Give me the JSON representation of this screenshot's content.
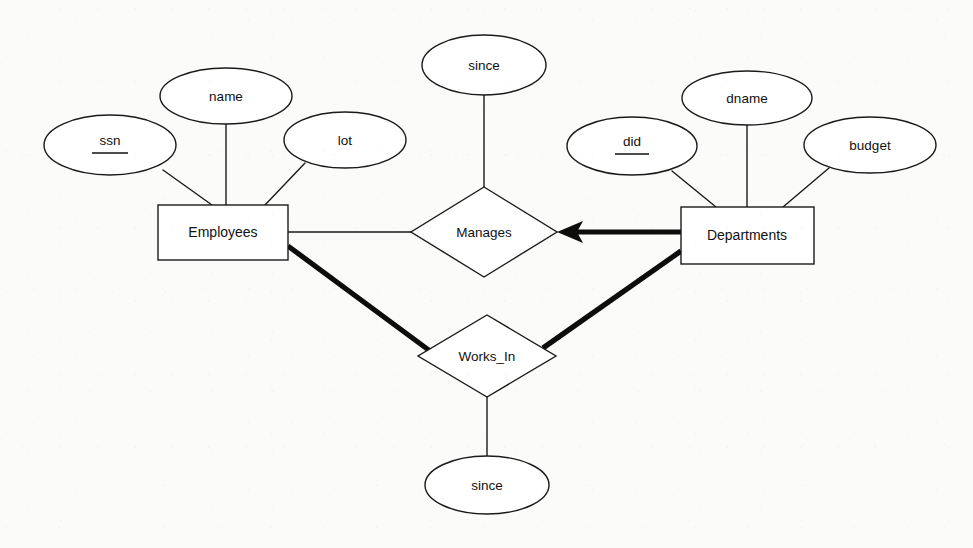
{
  "diagram": {
    "type": "entity-relationship-diagram",
    "notation": "Chen ER",
    "background_color": "#fbfbfa",
    "line_color": "#1a1a1a",
    "entities": [
      {
        "id": "employees",
        "label": "Employees",
        "shape": "rectangle",
        "x": 158,
        "y": 205,
        "width": 130,
        "height": 55
      },
      {
        "id": "departments",
        "label": "Departments",
        "shape": "rectangle",
        "x": 681,
        "y": 207,
        "width": 133,
        "height": 57
      }
    ],
    "relationships": [
      {
        "id": "manages",
        "label": "Manages",
        "shape": "diamond",
        "cx": 484,
        "cy": 232,
        "rx": 73,
        "ry": 45
      },
      {
        "id": "works_in",
        "label": "Works_In",
        "shape": "diamond",
        "cx": 487,
        "cy": 356,
        "rx": 69,
        "ry": 41
      }
    ],
    "attributes": [
      {
        "id": "ssn",
        "label": "ssn",
        "owner": "employees",
        "is_key": true,
        "cx": 110,
        "cy": 145,
        "rx": 66,
        "ry": 30
      },
      {
        "id": "name",
        "label": "name",
        "owner": "employees",
        "is_key": false,
        "cx": 226,
        "cy": 96,
        "rx": 66,
        "ry": 28
      },
      {
        "id": "lot",
        "label": "lot",
        "owner": "employees",
        "is_key": false,
        "cx": 345,
        "cy": 140,
        "rx": 61,
        "ry": 28
      },
      {
        "id": "since_manages",
        "label": "since",
        "owner": "manages",
        "is_key": false,
        "cx": 484,
        "cy": 65,
        "rx": 62,
        "ry": 30
      },
      {
        "id": "did",
        "label": "did",
        "owner": "departments",
        "is_key": true,
        "cx": 632,
        "cy": 146,
        "rx": 65,
        "ry": 29
      },
      {
        "id": "dname",
        "label": "dname",
        "owner": "departments",
        "is_key": false,
        "cx": 747,
        "cy": 98,
        "rx": 65,
        "ry": 27
      },
      {
        "id": "budget",
        "label": "budget",
        "owner": "departments",
        "is_key": false,
        "cx": 870,
        "cy": 145,
        "rx": 66,
        "ry": 28
      },
      {
        "id": "since_works_in",
        "label": "since",
        "owner": "works_in",
        "is_key": false,
        "cx": 487,
        "cy": 485,
        "rx": 62,
        "ry": 29
      }
    ],
    "edges": [
      {
        "id": "e-ssn",
        "from": "ssn",
        "to": "employees",
        "weight": "thin",
        "arrow": false
      },
      {
        "id": "e-name",
        "from": "name",
        "to": "employees",
        "weight": "thin",
        "arrow": false
      },
      {
        "id": "e-lot",
        "from": "lot",
        "to": "employees",
        "weight": "thin",
        "arrow": false
      },
      {
        "id": "e-did",
        "from": "did",
        "to": "departments",
        "weight": "thin",
        "arrow": false
      },
      {
        "id": "e-dname",
        "from": "dname",
        "to": "departments",
        "weight": "thin",
        "arrow": false
      },
      {
        "id": "e-budget",
        "from": "budget",
        "to": "departments",
        "weight": "thin",
        "arrow": false
      },
      {
        "id": "e-since-m",
        "from": "since_manages",
        "to": "manages",
        "weight": "thin",
        "arrow": false
      },
      {
        "id": "e-since-w",
        "from": "since_works_in",
        "to": "works_in",
        "weight": "thin",
        "arrow": false
      },
      {
        "id": "e-emp-man",
        "from": "employees",
        "to": "manages",
        "weight": "thin",
        "arrow": false
      },
      {
        "id": "e-dep-man",
        "from": "departments",
        "to": "manages",
        "weight": "thick",
        "arrow": true
      },
      {
        "id": "e-emp-wrk",
        "from": "employees",
        "to": "works_in",
        "weight": "thick",
        "arrow": false
      },
      {
        "id": "e-dep-wrk",
        "from": "departments",
        "to": "works_in",
        "weight": "thick",
        "arrow": false
      }
    ]
  }
}
